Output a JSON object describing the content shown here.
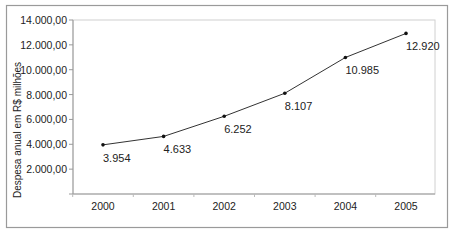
{
  "chart_data": {
    "type": "line",
    "title": "",
    "xlabel": "",
    "ylabel": "Despesa anual em R$ milhões",
    "categories": [
      "2000",
      "2001",
      "2002",
      "2003",
      "2004",
      "2005"
    ],
    "series": [
      {
        "name": "Despesa anual",
        "values": [
          3954,
          4633,
          6252,
          8107,
          10985,
          12920
        ],
        "labels": [
          "3.954",
          "4.633",
          "6.252",
          "8.107",
          "10.985",
          "12.920"
        ]
      }
    ],
    "ylim": [
      0,
      14000
    ],
    "yticks": [
      0,
      2000,
      4000,
      6000,
      8000,
      10000,
      12000,
      14000
    ],
    "ytick_labels": [
      "",
      "2.000,00",
      "4.000,00",
      "6.000,00",
      "8.000,00",
      "10.000,00",
      "12.000,00",
      "14.000,00"
    ],
    "grid": false,
    "legend": "none",
    "colors": {
      "line": "#333333",
      "marker": "#111111",
      "frame": "#9a9a9a",
      "plot_border": "#d0d0d0"
    }
  }
}
